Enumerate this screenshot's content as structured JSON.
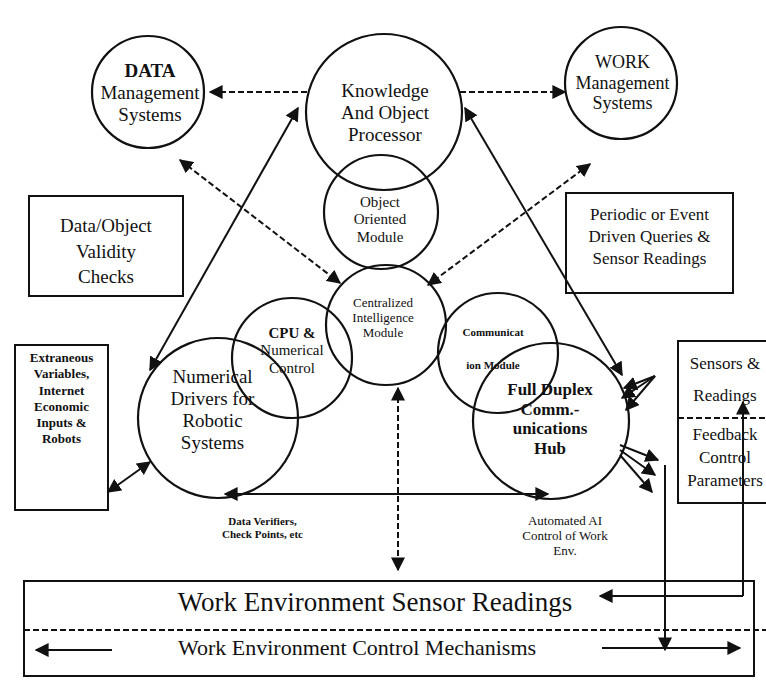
{
  "diagram": {
    "nodes": {
      "data_mgmt": {
        "lines": [
          "DATA",
          "Management",
          "Systems"
        ]
      },
      "knowledge": {
        "lines": [
          "Knowledge",
          "And Object",
          "Processor"
        ]
      },
      "work_mgmt": {
        "lines": [
          "WORK",
          "Management",
          "Systems"
        ]
      },
      "object_oriented": {
        "lines": [
          "Object",
          "Oriented",
          "Module"
        ]
      },
      "central": {
        "lines": [
          "Centralized",
          "Intelligence",
          "Module"
        ]
      },
      "cpu": {
        "lines": [
          "CPU &",
          "Numerical",
          "Control"
        ]
      },
      "comm_module": {
        "lines": [
          "Communicat",
          "ion Module"
        ]
      },
      "numerical_drivers": {
        "lines": [
          "Numerical",
          "Drivers for",
          "Robotic",
          "Systems"
        ]
      },
      "duplex_hub": {
        "lines": [
          "Full Duplex",
          "Comm.-",
          "unications",
          "Hub"
        ]
      }
    },
    "boxes": {
      "validity": {
        "lines": [
          "Data/Object",
          "Validity",
          "Checks"
        ]
      },
      "queries": {
        "lines": [
          "Periodic or Event",
          "Driven Queries &",
          "Sensor Readings"
        ]
      },
      "extraneous": {
        "lines": [
          "Extraneous",
          "Variables,",
          "Internet",
          "Economic",
          "Inputs &",
          "Robots"
        ]
      },
      "sensors": {
        "lines": [
          "Sensors &",
          "Readings"
        ]
      },
      "feedback": {
        "lines": [
          "Feedback",
          "Control",
          "Parameters"
        ]
      }
    },
    "annotations": {
      "data_verifiers": {
        "lines": [
          "Data Verifiers,",
          "Check Points, etc"
        ]
      },
      "automated_ai": {
        "lines": [
          "Automated AI",
          "Control of Work",
          "Env."
        ]
      }
    },
    "bottom_panel": {
      "sensor_readings": "Work Environment Sensor Readings",
      "control_mechanisms": "Work Environment Control Mechanisms"
    }
  }
}
